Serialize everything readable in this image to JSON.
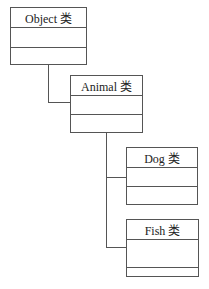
{
  "diagram": {
    "type": "class-hierarchy",
    "classes": [
      {
        "id": "object",
        "label": "Object 类"
      },
      {
        "id": "animal",
        "label": "Animal 类",
        "parent": "object"
      },
      {
        "id": "dog",
        "label": "Dog 类",
        "parent": "animal"
      },
      {
        "id": "fish",
        "label": "Fish 类",
        "parent": "animal"
      }
    ],
    "colors": {
      "line": "#555555",
      "background": "#ffffff",
      "text": "#222222"
    }
  }
}
